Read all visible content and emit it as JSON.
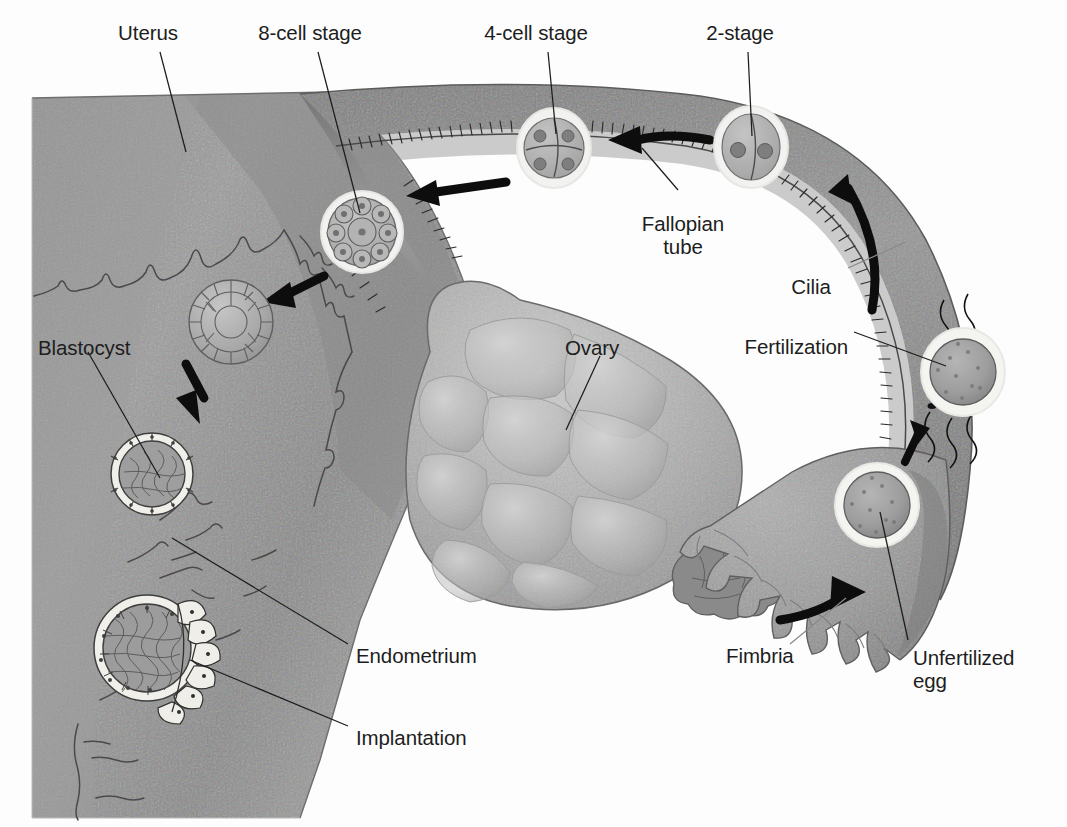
{
  "figure": {
    "type": "anatomical-diagram",
    "background_color": "#fdfdfd",
    "ink_color": "#1d1d1d",
    "tissue_color": "#989898",
    "tissue_dark": "#6f6f6f",
    "tissue_light": "#c9c9c9",
    "highlight_color": "#f2f2f0"
  },
  "labels": [
    {
      "id": "uterus",
      "text": "Uterus",
      "x": 148,
      "y": 32,
      "align": "center"
    },
    {
      "id": "eight-cell-stage",
      "text": "8-cell stage",
      "x": 310,
      "y": 32,
      "align": "center"
    },
    {
      "id": "four-cell-stage",
      "text": "4-cell stage",
      "x": 536,
      "y": 32,
      "align": "center"
    },
    {
      "id": "two-stage",
      "text": "2-stage",
      "x": 740,
      "y": 32,
      "align": "center"
    },
    {
      "id": "fallopian-tube",
      "text": "Fallopian\ntube",
      "x": 683,
      "y": 212,
      "align": "center"
    },
    {
      "id": "cilia",
      "text": "Cilia",
      "x": 811,
      "y": 275,
      "align": "center"
    },
    {
      "id": "fertilization",
      "text": "Fertilization",
      "x": 846,
      "y": 338,
      "align": "right"
    },
    {
      "id": "ovary",
      "text": "Ovary",
      "x": 592,
      "y": 338,
      "align": "center"
    },
    {
      "id": "blastocyst",
      "text": "Blastocyst",
      "x": 88,
      "y": 338,
      "align": "left"
    },
    {
      "id": "endometrium",
      "text": "Endometrium",
      "x": 356,
      "y": 644,
      "align": "left"
    },
    {
      "id": "implantation",
      "text": "Implantation",
      "x": 356,
      "y": 726,
      "align": "left"
    },
    {
      "id": "fimbria",
      "text": "Fimbria",
      "x": 726,
      "y": 644,
      "align": "left"
    },
    {
      "id": "unfertilized-egg",
      "text": "Unfertilized\negg",
      "x": 913,
      "y": 646,
      "align": "left"
    }
  ],
  "structures": [
    {
      "id": "uterus-body",
      "name": "Uterus",
      "description": "Large wedge-shaped uterine wall on the left with thick endometrial lining"
    },
    {
      "id": "fallopian-tube",
      "name": "Fallopian tube",
      "description": "Arching ciliated tube from uterus to fimbria across the top of the figure"
    },
    {
      "id": "ovary",
      "name": "Ovary",
      "description": "Lobulated oval body in the lower centre with a ruptured follicle at its right tip"
    },
    {
      "id": "fimbria",
      "name": "Fimbria",
      "description": "Finger-like projections at the distal end of the tube that sweep up the egg"
    },
    {
      "id": "endometrium",
      "name": "Endometrium",
      "description": "Glandular uterine lining along the inner uterine surface"
    },
    {
      "id": "cilia",
      "name": "Cilia",
      "description": "Hair-like projections lining the inner wall of the fallopian tube"
    }
  ],
  "stages": [
    {
      "id": "unfertilized-egg",
      "label": "Unfertilized egg",
      "cells": 1,
      "cx": 877,
      "cy": 505,
      "r": 40,
      "note": "Ovulated oocyte captured by the fimbria"
    },
    {
      "id": "fertilization",
      "label": "Fertilization",
      "cells": 1,
      "cx": 963,
      "cy": 372,
      "r": 40,
      "note": "Sperm reach and penetrate the egg"
    },
    {
      "id": "two-stage",
      "label": "2-stage",
      "cells": 2,
      "cx": 751,
      "cy": 147,
      "r": 34,
      "note": "Two-cell zygote"
    },
    {
      "id": "four-cell-stage",
      "label": "4-cell stage",
      "cells": 4,
      "cx": 554,
      "cy": 148,
      "r": 34,
      "note": "Four-cell cleavage stage"
    },
    {
      "id": "eight-cell-stage",
      "label": "8-cell stage",
      "cells": 8,
      "cx": 362,
      "cy": 232,
      "r": 39,
      "note": "Eight-cell cleavage stage"
    },
    {
      "id": "morula",
      "label": "",
      "cells": 32,
      "cx": 231,
      "cy": 322,
      "r": 42,
      "note": "Morula, unlabelled"
    },
    {
      "id": "blastocyst",
      "label": "Blastocyst",
      "cells": 0,
      "cx": 152,
      "cy": 474,
      "r": 41,
      "note": "Blastocyst with inner cell mass and trophoblast"
    },
    {
      "id": "implantation",
      "label": "Implantation",
      "cells": 0,
      "cx": 147,
      "cy": 648,
      "r": 53,
      "note": "Blastocyst burrowing into the endometrium"
    }
  ],
  "arrows": [
    {
      "id": "arrow-ovulation",
      "from": "ovary",
      "to": "fimbria",
      "shape": "curved"
    },
    {
      "id": "arrow-sperm-to-egg",
      "from": "unfertilized-egg",
      "to": "fertilization",
      "shape": "straight"
    },
    {
      "id": "arrow-up-tube",
      "from": "fertilization",
      "to": "two-stage",
      "shape": "curved"
    },
    {
      "id": "arrow-2-to-4",
      "from": "two-stage",
      "to": "four-cell-stage",
      "shape": "straight"
    },
    {
      "id": "arrow-4-to-8",
      "from": "four-cell-stage",
      "to": "eight-cell-stage",
      "shape": "straight"
    },
    {
      "id": "arrow-8-to-morula",
      "from": "eight-cell-stage",
      "to": "morula",
      "shape": "straight"
    },
    {
      "id": "arrow-to-blastocyst",
      "from": "morula",
      "to": "blastocyst",
      "shape": "straight"
    }
  ]
}
